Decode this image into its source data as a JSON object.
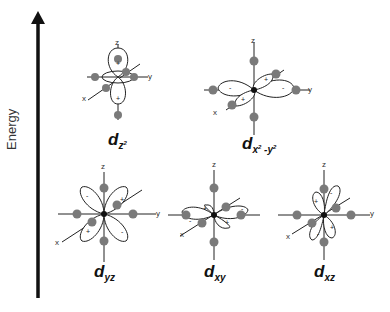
{
  "axis": {
    "label": "Energy",
    "direction": "up"
  },
  "axis_letters": {
    "z": "z",
    "y": "y",
    "x": "x"
  },
  "signs": {
    "plus": "+",
    "minus": "-"
  },
  "orbitals": [
    {
      "id": "dz2",
      "letter": "d",
      "subscript": "z",
      "superscript": "2",
      "level": "upper"
    },
    {
      "id": "dx2-y2",
      "letter": "d",
      "subscript_a": "x",
      "sup_a": "2",
      "sep": " -",
      "subscript_b": "y",
      "sup_b": "2",
      "level": "upper"
    },
    {
      "id": "dyz",
      "letter": "d",
      "subscript": "yz",
      "level": "lower"
    },
    {
      "id": "dxy",
      "letter": "d",
      "subscript": "xy",
      "level": "lower"
    },
    {
      "id": "dxz",
      "letter": "d",
      "subscript": "xz",
      "level": "lower"
    }
  ],
  "colors": {
    "ligand": "#7a7a7a",
    "line": "#222222",
    "arrow": "#111111"
  }
}
